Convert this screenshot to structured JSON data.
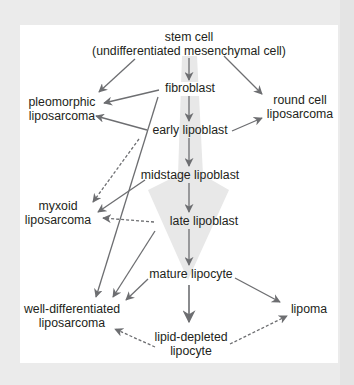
{
  "diagram": {
    "type": "differentiation-pathway",
    "colors": {
      "background": "#ebebeb",
      "panel": "#ffffff",
      "arrow": "#6d6e71",
      "big_arrow": "#e6e6e6",
      "text": "#231f20"
    },
    "nodes": {
      "stem_cell": {
        "line1": "stem cell",
        "line2": "(undifferentiated mesenchymal cell)"
      },
      "fibroblast": {
        "label": "fibroblast"
      },
      "early_lipoblast": {
        "label": "early lipoblast"
      },
      "midstage_lipoblast": {
        "label": "midstage lipoblast"
      },
      "late_lipoblast": {
        "label": "late lipoblast"
      },
      "mature_lipocyte": {
        "label": "mature lipocyte"
      },
      "lipid_depleted_lipocyte": {
        "line1": "lipid-depleted",
        "line2": "lipocyte"
      },
      "pleomorphic_liposarcoma": {
        "line1": "pleomorphic",
        "line2": "liposarcoma"
      },
      "round_cell_liposarcoma": {
        "line1": "round cell",
        "line2": "liposarcoma"
      },
      "myxoid_liposarcoma": {
        "line1": "myxoid",
        "line2": "liposarcoma"
      },
      "well_differentiated_liposarcoma": {
        "line1": "well-differentiated",
        "line2": "liposarcoma"
      },
      "lipoma": {
        "label": "lipoma"
      }
    },
    "edges": [
      {
        "from": "stem_cell",
        "to": "fibroblast",
        "style": "solid"
      },
      {
        "from": "fibroblast",
        "to": "early_lipoblast",
        "style": "solid"
      },
      {
        "from": "early_lipoblast",
        "to": "midstage_lipoblast",
        "style": "solid"
      },
      {
        "from": "midstage_lipoblast",
        "to": "late_lipoblast",
        "style": "solid"
      },
      {
        "from": "late_lipoblast",
        "to": "mature_lipocyte",
        "style": "solid"
      },
      {
        "from": "mature_lipocyte",
        "to": "lipid_depleted_lipocyte",
        "style": "solid"
      },
      {
        "from": "stem_cell",
        "to": "pleomorphic_liposarcoma",
        "style": "solid"
      },
      {
        "from": "stem_cell",
        "to": "round_cell_liposarcoma",
        "style": "solid"
      },
      {
        "from": "fibroblast",
        "to": "pleomorphic_liposarcoma",
        "style": "solid"
      },
      {
        "from": "early_lipoblast",
        "to": "pleomorphic_liposarcoma",
        "style": "solid"
      },
      {
        "from": "early_lipoblast",
        "to": "round_cell_liposarcoma",
        "style": "solid"
      },
      {
        "from": "fibroblast",
        "to": "well_differentiated_liposarcoma",
        "style": "solid"
      },
      {
        "from": "early_lipoblast",
        "to": "myxoid_liposarcoma",
        "style": "dashed"
      },
      {
        "from": "midstage_lipoblast",
        "to": "myxoid_liposarcoma",
        "style": "solid"
      },
      {
        "from": "late_lipoblast",
        "to": "myxoid_liposarcoma",
        "style": "dashed"
      },
      {
        "from": "late_lipoblast",
        "to": "well_differentiated_liposarcoma",
        "style": "solid"
      },
      {
        "from": "mature_lipocyte",
        "to": "well_differentiated_liposarcoma",
        "style": "solid"
      },
      {
        "from": "mature_lipocyte",
        "to": "lipoma",
        "style": "solid"
      },
      {
        "from": "lipid_depleted_lipocyte",
        "to": "well_differentiated_liposarcoma",
        "style": "dashed"
      },
      {
        "from": "lipid_depleted_lipocyte",
        "to": "lipoma",
        "style": "dashed"
      }
    ]
  }
}
